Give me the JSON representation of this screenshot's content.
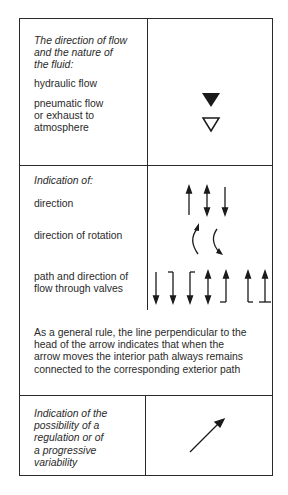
{
  "section_flow": {
    "heading": [
      "The direction of flow",
      "and the nature of",
      "the fluid:"
    ],
    "items": [
      {
        "label": [
          "hydraulic flow"
        ],
        "symbol": "filled-triangle-down"
      },
      {
        "label": [
          "pneumatic flow",
          "or exhaust to",
          "atmosphere"
        ],
        "symbol": "hollow-triangle-down"
      }
    ]
  },
  "section_indication": {
    "heading": "Indication of:",
    "items": [
      {
        "label": [
          "direction"
        ],
        "symbols": [
          "arrow-up",
          "arrow-up-down",
          "arrow-down"
        ]
      },
      {
        "label": [
          "direction of rotation"
        ],
        "symbols": [
          "curved-arrow-top",
          "curved-arrow-bottom"
        ]
      },
      {
        "label": [
          "path and direction of",
          "flow through valves"
        ],
        "symbols": [
          "arrow-down",
          "hook-right-arrow-down",
          "hook-left-arrow-down",
          "arrow-up-down",
          "arrow-up-foot-left",
          "arrow-up-foot-right",
          "arrow-up-foot-t"
        ]
      }
    ],
    "general_rule": [
      "As a general rule, the line perpendicular to the",
      "head of the arrow indicates that when the",
      "arrow moves the interior path always remains",
      "connected to the corresponding exterior path"
    ]
  },
  "section_regulation": {
    "label": [
      "Indication of the",
      "possibility of a",
      "regulation or of",
      "a progressive",
      "variability"
    ],
    "symbol": "diagonal-arrow"
  }
}
